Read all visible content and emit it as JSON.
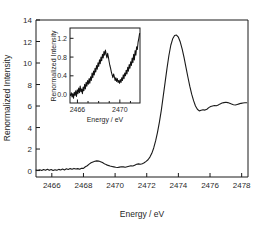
{
  "figure": {
    "background": "#ffffff",
    "line_color": "#1a1a1a"
  },
  "chart_data": {
    "type": "line",
    "title": "",
    "xlabel": "Energy / eV",
    "ylabel": "Renormalized Intensity",
    "xlim": [
      2465.0,
      2478.4
    ],
    "ylim": [
      -0.6,
      14.0
    ],
    "xticks": [
      2466,
      2468,
      2470,
      2472,
      2474,
      2476,
      2478
    ],
    "yticks": [
      0,
      2,
      4,
      6,
      8,
      10,
      12,
      14
    ],
    "xticklabels": [
      "2466",
      "2468",
      "2470",
      "2472",
      "2474",
      "2476",
      "2478"
    ],
    "yticklabels": [
      "0",
      "2",
      "4",
      "6",
      "8",
      "10",
      "12",
      "14"
    ],
    "grid": false,
    "legend": false,
    "series": [
      {
        "name": "Renormalized Intensity",
        "x": [
          2465.0,
          2465.12,
          2465.24,
          2465.36,
          2465.48,
          2465.6,
          2465.72,
          2465.84,
          2465.96,
          2466.08,
          2466.2,
          2466.32,
          2466.44,
          2466.56,
          2466.68,
          2466.8,
          2466.92,
          2467.04,
          2467.16,
          2467.28,
          2467.4,
          2467.52,
          2467.64,
          2467.76,
          2467.88,
          2468.0,
          2468.12,
          2468.24,
          2468.36,
          2468.48,
          2468.6,
          2468.72,
          2468.84,
          2468.96,
          2469.08,
          2469.2,
          2469.32,
          2469.44,
          2469.56,
          2469.68,
          2469.8,
          2469.92,
          2470.04,
          2470.16,
          2470.28,
          2470.4,
          2470.52,
          2470.64,
          2470.76,
          2470.88,
          2471.0,
          2471.12,
          2471.24,
          2471.36,
          2471.48,
          2471.6,
          2471.72,
          2471.84,
          2471.96,
          2472.08,
          2472.2,
          2472.32,
          2472.44,
          2472.56,
          2472.68,
          2472.8,
          2472.92,
          2473.04,
          2473.16,
          2473.28,
          2473.4,
          2473.52,
          2473.64,
          2473.76,
          2473.88,
          2474.0,
          2474.12,
          2474.24,
          2474.36,
          2474.48,
          2474.6,
          2474.72,
          2474.84,
          2474.96,
          2475.08,
          2475.2,
          2475.32,
          2475.44,
          2475.56,
          2475.68,
          2475.8,
          2475.92,
          2476.04,
          2476.16,
          2476.28,
          2476.4,
          2476.52,
          2476.64,
          2476.76,
          2476.88,
          2477.0,
          2477.12,
          2477.24,
          2477.36,
          2477.48,
          2477.6,
          2477.72,
          2477.84,
          2477.96,
          2478.08,
          2478.2,
          2478.32
        ],
        "y": [
          0.05,
          0.02,
          0.08,
          0.0,
          0.1,
          0.03,
          0.12,
          0.02,
          0.09,
          0.0,
          0.07,
          0.02,
          0.11,
          0.05,
          0.14,
          0.06,
          0.16,
          0.1,
          0.18,
          0.12,
          0.2,
          0.14,
          0.18,
          0.12,
          0.22,
          0.2,
          0.35,
          0.45,
          0.6,
          0.72,
          0.8,
          0.86,
          0.9,
          0.88,
          0.82,
          0.74,
          0.64,
          0.55,
          0.48,
          0.42,
          0.38,
          0.34,
          0.3,
          0.28,
          0.32,
          0.36,
          0.34,
          0.3,
          0.35,
          0.4,
          0.45,
          0.42,
          0.5,
          0.58,
          0.62,
          0.58,
          0.64,
          0.72,
          0.85,
          1.0,
          1.25,
          1.6,
          2.1,
          2.75,
          3.55,
          4.5,
          5.6,
          6.9,
          8.2,
          9.5,
          10.7,
          11.65,
          12.25,
          12.55,
          12.6,
          12.4,
          11.95,
          11.3,
          10.5,
          9.6,
          8.7,
          7.85,
          7.1,
          6.5,
          6.0,
          5.7,
          5.55,
          5.6,
          5.65,
          5.62,
          5.7,
          5.85,
          5.95,
          6.0,
          6.05,
          6.02,
          6.1,
          6.2,
          6.28,
          6.32,
          6.35,
          6.32,
          6.25,
          6.18,
          6.12,
          6.1,
          6.15,
          6.2,
          6.25,
          6.28,
          6.3,
          6.3
        ]
      }
    ],
    "annotations": {
      "peak_energy": 2473.6,
      "peak_intensity": 12.6,
      "post_edge_min_energy": 2475.3,
      "post_edge_min_intensity": 5.55
    },
    "inset": {
      "type": "line",
      "title": "",
      "xlabel": "Energy / eV",
      "ylabel": "Renormalized Intensity",
      "xlim": [
        2465.3,
        2471.9
      ],
      "ylim": [
        -0.18,
        1.42
      ],
      "xticks": [
        2466,
        2470
      ],
      "xticks_minor": [
        2467,
        2468,
        2469,
        2471
      ],
      "yticks": [
        0.0,
        0.4,
        0.8,
        1.2
      ],
      "xticklabels": [
        "2466",
        "2470"
      ],
      "yticklabels": [
        "0.0",
        "0.4",
        "0.8",
        "1.2"
      ],
      "grid": false,
      "legend": false,
      "series": [
        {
          "name": "Renormalized Intensity (pre-edge detail)",
          "x": [
            2465.35,
            2465.42,
            2465.49,
            2465.56,
            2465.63,
            2465.7,
            2465.77,
            2465.84,
            2465.91,
            2465.98,
            2466.05,
            2466.12,
            2466.19,
            2466.26,
            2466.33,
            2466.4,
            2466.47,
            2466.54,
            2466.61,
            2466.68,
            2466.75,
            2466.82,
            2466.89,
            2466.96,
            2467.03,
            2467.1,
            2467.17,
            2467.24,
            2467.31,
            2467.38,
            2467.45,
            2467.52,
            2467.59,
            2467.66,
            2467.73,
            2467.8,
            2467.87,
            2467.94,
            2468.01,
            2468.08,
            2468.15,
            2468.22,
            2468.29,
            2468.36,
            2468.43,
            2468.5,
            2468.57,
            2468.64,
            2468.71,
            2468.78,
            2468.85,
            2468.92,
            2468.99,
            2469.06,
            2469.13,
            2469.2,
            2469.27,
            2469.34,
            2469.41,
            2469.48,
            2469.55,
            2469.62,
            2469.69,
            2469.76,
            2469.83,
            2469.9,
            2469.97,
            2470.04,
            2470.11,
            2470.18,
            2470.25,
            2470.32,
            2470.39,
            2470.46,
            2470.53,
            2470.6,
            2470.67,
            2470.74,
            2470.81,
            2470.88,
            2470.95,
            2471.02,
            2471.09,
            2471.16,
            2471.23,
            2471.3,
            2471.37,
            2471.44,
            2471.51,
            2471.58,
            2471.65,
            2471.72,
            2471.79,
            2471.86
          ],
          "y": [
            -0.02,
            0.04,
            -0.05,
            0.02,
            -0.08,
            0.05,
            -0.02,
            0.08,
            -0.04,
            0.1,
            0.02,
            0.14,
            0.04,
            0.18,
            0.06,
            0.12,
            0.02,
            0.16,
            0.08,
            0.22,
            0.12,
            0.26,
            0.18,
            0.3,
            0.22,
            0.34,
            0.24,
            0.38,
            0.3,
            0.46,
            0.36,
            0.5,
            0.42,
            0.56,
            0.48,
            0.62,
            0.54,
            0.68,
            0.6,
            0.74,
            0.66,
            0.8,
            0.72,
            0.86,
            0.78,
            0.92,
            0.84,
            0.95,
            0.86,
            0.78,
            0.88,
            0.8,
            0.7,
            0.62,
            0.56,
            0.48,
            0.42,
            0.36,
            0.44,
            0.38,
            0.3,
            0.36,
            0.28,
            0.34,
            0.26,
            0.3,
            0.24,
            0.32,
            0.26,
            0.36,
            0.3,
            0.42,
            0.34,
            0.46,
            0.4,
            0.52,
            0.44,
            0.58,
            0.5,
            0.64,
            0.56,
            0.7,
            0.62,
            0.78,
            0.68,
            0.86,
            0.74,
            0.94,
            0.84,
            1.02,
            0.96,
            1.12,
            1.2,
            1.3
          ]
        }
      ]
    }
  }
}
